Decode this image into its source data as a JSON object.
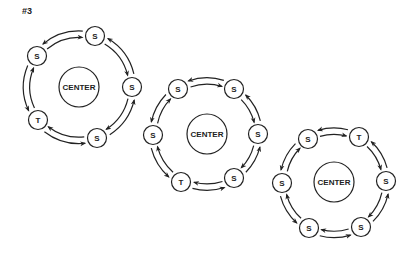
{
  "title": "#3",
  "colors": {
    "stroke": "#222222",
    "background": "#ffffff"
  },
  "diagrams": [
    {
      "id": "diagram-1",
      "center": {
        "label": "CENTER",
        "x": 79,
        "y": 87,
        "r": 20
      },
      "node_radius": 9.5,
      "nodes": [
        {
          "label": "S",
          "x": 95,
          "y": 36
        },
        {
          "label": "S",
          "x": 132,
          "y": 87
        },
        {
          "label": "S",
          "x": 97,
          "y": 138
        },
        {
          "label": "T",
          "x": 38,
          "y": 120
        },
        {
          "label": "S",
          "x": 37,
          "y": 56
        }
      ]
    },
    {
      "id": "diagram-2",
      "center": {
        "label": "CENTER",
        "x": 207,
        "y": 134,
        "r": 20
      },
      "node_radius": 9.5,
      "nodes": [
        {
          "label": "S",
          "x": 178,
          "y": 89
        },
        {
          "label": "S",
          "x": 234,
          "y": 89
        },
        {
          "label": "S",
          "x": 258,
          "y": 134
        },
        {
          "label": "S",
          "x": 234,
          "y": 178
        },
        {
          "label": "T",
          "x": 181,
          "y": 182
        },
        {
          "label": "S",
          "x": 153,
          "y": 135
        }
      ]
    },
    {
      "id": "diagram-3",
      "center": {
        "label": "CENTER",
        "x": 334,
        "y": 182,
        "r": 20
      },
      "node_radius": 9.5,
      "nodes": [
        {
          "label": "S",
          "x": 308,
          "y": 139
        },
        {
          "label": "T",
          "x": 359,
          "y": 137
        },
        {
          "label": "S",
          "x": 386,
          "y": 181
        },
        {
          "label": "S",
          "x": 361,
          "y": 227
        },
        {
          "label": "S",
          "x": 309,
          "y": 228
        },
        {
          "label": "S",
          "x": 282,
          "y": 183
        }
      ]
    }
  ],
  "arrows": {
    "outer_direction": "counterclockwise",
    "inner_direction": "clockwise"
  }
}
